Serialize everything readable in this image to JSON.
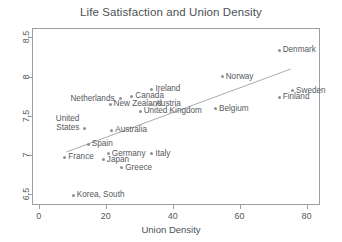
{
  "chart_data": {
    "type": "scatter",
    "title": "Life Satisfaction and Union Density",
    "xlabel": "Union Density",
    "ylabel": "",
    "xlim": [
      -2,
      84
    ],
    "ylim": [
      6.36,
      8.62
    ],
    "xticks": [
      "0",
      "20",
      "40",
      "60",
      "80"
    ],
    "xtick_values": [
      0,
      20,
      40,
      60,
      80
    ],
    "yticks": [
      "6.5",
      "7",
      "7.5",
      "8",
      "8.5"
    ],
    "ytick_values": [
      6.5,
      7,
      7.5,
      8,
      8.5
    ],
    "grid": false,
    "legend": "none",
    "marker_color": "#8b9096",
    "line_color": "#a8adb2",
    "axis_color": "#9a9fa3",
    "text_color": "#55595d",
    "points": [
      {
        "label": "Denmark",
        "x": 71.5,
        "y": 8.35,
        "side": "right"
      },
      {
        "label": "Norway",
        "x": 54.5,
        "y": 8.01,
        "side": "right"
      },
      {
        "label": "Sweden",
        "x": 75.5,
        "y": 7.83,
        "side": "right"
      },
      {
        "label": "Finland",
        "x": 71.5,
        "y": 7.75,
        "side": "right"
      },
      {
        "label": "Ireland",
        "x": 33.5,
        "y": 7.85,
        "side": "right"
      },
      {
        "label": "Canada",
        "x": 27.5,
        "y": 7.76,
        "side": "right"
      },
      {
        "label": "Netherlands",
        "x": 24.0,
        "y": 7.73,
        "side": "left"
      },
      {
        "label": "New Zealand",
        "x": 21.0,
        "y": 7.66,
        "side": "right"
      },
      {
        "label": "Austria",
        "x": 33.5,
        "y": 7.66,
        "side": "right"
      },
      {
        "label": "United Kingdom",
        "x": 30.0,
        "y": 7.57,
        "side": "right"
      },
      {
        "label": "Belgium",
        "x": 52.5,
        "y": 7.6,
        "side": "right"
      },
      {
        "label": "United States",
        "x": 13.5,
        "y": 7.35,
        "side": "left"
      },
      {
        "label": "Australia",
        "x": 21.5,
        "y": 7.33,
        "side": "right"
      },
      {
        "label": "Spain",
        "x": 14.5,
        "y": 7.15,
        "side": "right"
      },
      {
        "label": "France",
        "x": 7.5,
        "y": 6.98,
        "side": "right"
      },
      {
        "label": "Germany",
        "x": 20.5,
        "y": 7.03,
        "side": "right"
      },
      {
        "label": "Japan",
        "x": 19.0,
        "y": 6.95,
        "side": "right"
      },
      {
        "label": "Italy",
        "x": 33.5,
        "y": 7.03,
        "side": "right"
      },
      {
        "label": "Greece",
        "x": 24.5,
        "y": 6.85,
        "side": "right"
      },
      {
        "label": "Korea, South",
        "x": 10.0,
        "y": 6.5,
        "side": "right"
      }
    ],
    "trend_line": {
      "x_start": 8.0,
      "y_start": 7.05,
      "x_end": 75.0,
      "y_end": 8.11
    }
  }
}
